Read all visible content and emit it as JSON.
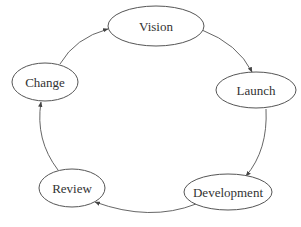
{
  "diagram": {
    "type": "cycle",
    "nodes": [
      {
        "id": "vision",
        "label": "Vision"
      },
      {
        "id": "launch",
        "label": "Launch"
      },
      {
        "id": "development",
        "label": "Development"
      },
      {
        "id": "review",
        "label": "Review"
      },
      {
        "id": "change",
        "label": "Change"
      }
    ],
    "edges": [
      {
        "from": "vision",
        "to": "launch"
      },
      {
        "from": "launch",
        "to": "development"
      },
      {
        "from": "development",
        "to": "review"
      },
      {
        "from": "review",
        "to": "change"
      },
      {
        "from": "change",
        "to": "vision"
      }
    ],
    "colors": {
      "stroke": "#555555",
      "text": "#333333",
      "background": "#ffffff"
    }
  }
}
